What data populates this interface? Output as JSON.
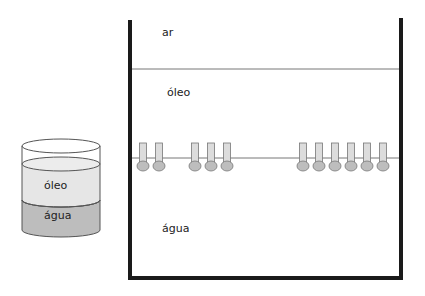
{
  "beaker": {
    "layer_top_label": "óleo",
    "layer_bottom_label": "água",
    "colors": {
      "oil": "#e6e6e6",
      "water": "#bdbdbd",
      "outline": "#444444"
    }
  },
  "tank": {
    "label_air": "ar",
    "label_oil": "óleo",
    "label_water": "água",
    "colors": {
      "wall": "#1a1a1a",
      "interface": "#777777",
      "molecule_tail": "#dcdcdc",
      "molecule_head": "#bdbdbd"
    },
    "molecules_x": [
      143,
      159,
      195,
      211,
      227,
      303,
      319,
      335,
      351,
      367,
      383
    ]
  }
}
